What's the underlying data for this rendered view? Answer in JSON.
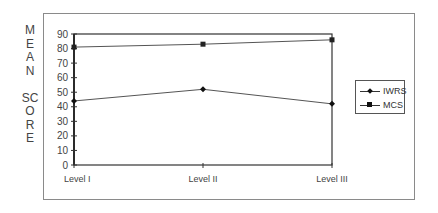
{
  "chart_data": {
    "type": "line",
    "title": "",
    "xlabel": "",
    "ylabel": "MEAN SCORE",
    "ylim": [
      0,
      90
    ],
    "yticks": [
      0,
      10,
      20,
      30,
      40,
      50,
      60,
      70,
      80,
      90
    ],
    "categories": [
      "Level I",
      "Level II",
      "Level III"
    ],
    "series": [
      {
        "name": "IWRS",
        "marker": "diamond",
        "values": [
          44,
          52,
          42
        ]
      },
      {
        "name": "MCS",
        "marker": "square",
        "values": [
          81,
          83,
          86
        ]
      }
    ],
    "legend_position": "right",
    "grid": false
  },
  "ylabel_letters": [
    "M",
    "E",
    "A",
    "N",
    "",
    "SC",
    "O",
    "R",
    "E"
  ],
  "legend": {
    "items": [
      "IWRS",
      "MCS"
    ]
  }
}
